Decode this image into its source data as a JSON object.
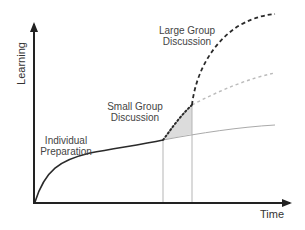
{
  "diagram": {
    "axes": {
      "y_label": "Learning",
      "x_label": "Time"
    },
    "phases": [
      {
        "id": "individual",
        "line1": "Individual",
        "line2": "Preparation"
      },
      {
        "id": "small-group",
        "line1": "Small Group",
        "line2": "Discussion"
      },
      {
        "id": "large-group",
        "line1": "Large Group",
        "line2": "Discussion"
      }
    ],
    "colors": {
      "axis": "#222222",
      "main_curve": "#2a2a2a",
      "baseline_continuation": "#aaaaaa",
      "shaded_gain": "#dcdcdc",
      "dotted_projection": "#bbbbbb",
      "guide_lines": "#b5b5b5"
    }
  }
}
